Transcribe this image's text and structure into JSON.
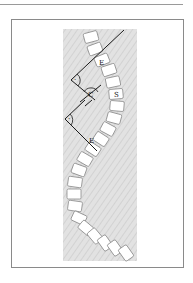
{
  "diagram": {
    "labels": {
      "end_vertebra_upper": "E",
      "cobb_angle": "C",
      "apex_vertebra": "S",
      "end_vertebra_lower": "E",
      "right_angle_upper": "·",
      "right_angle_lower": "·"
    },
    "colors": {
      "background_band": "#dcdcdc",
      "vertebra_fill": "#ffffff",
      "vertebra_stroke": "#8c8c8c",
      "line": "#1a1a1a",
      "frame": "#8a8a8a"
    }
  }
}
